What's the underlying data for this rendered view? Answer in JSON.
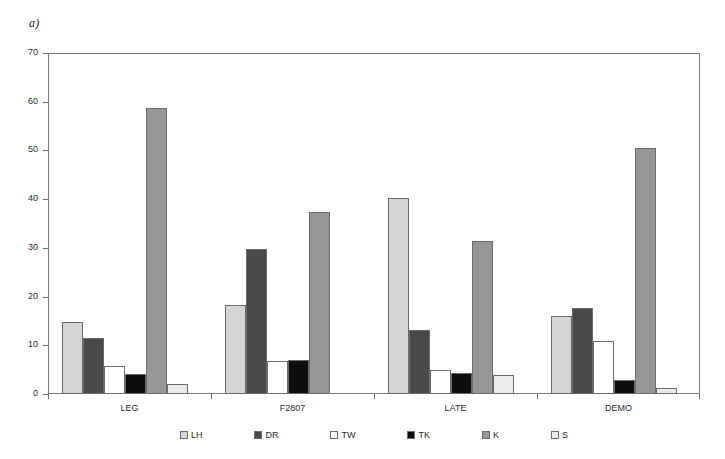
{
  "panel": {
    "label": "a)"
  },
  "chart_data": {
    "type": "bar",
    "title": "",
    "subtitle": "",
    "xlabel": "",
    "ylabel": "",
    "ylim": [
      0,
      70
    ],
    "yticks": [
      0,
      10,
      20,
      30,
      40,
      50,
      60,
      70
    ],
    "ytick_labels": [
      "0",
      "10",
      "20",
      "30",
      "40",
      "50",
      "60",
      "70"
    ],
    "grid": false,
    "legend_position": "bottom",
    "categories": [
      "LEG",
      "F2807",
      "LATE",
      "DEMO"
    ],
    "series": [
      {
        "name": "LH",
        "color": "#d4d4d4",
        "values": [
          14.8,
          18.2,
          40.2,
          16.0
        ]
      },
      {
        "name": "DR",
        "color": "#4a4a4a",
        "values": [
          11.6,
          29.8,
          13.2,
          17.6
        ]
      },
      {
        "name": "TW",
        "color": "#ffffff",
        "values": [
          5.7,
          6.7,
          4.9,
          10.8
        ]
      },
      {
        "name": "TK",
        "color": "#0d0d0d",
        "values": [
          4.2,
          7.0,
          4.4,
          2.8
        ]
      },
      {
        "name": "K",
        "color": "#969696",
        "values": [
          58.8,
          37.3,
          31.5,
          50.4
        ]
      },
      {
        "name": "S",
        "color": "#ebebeb",
        "values": [
          2.0,
          0.0,
          4.0,
          1.3
        ]
      }
    ]
  },
  "colors": {
    "axis": "#7d7d7d",
    "tick": "#6e6e6e",
    "bar_outline": "#6b6b6b",
    "text": "#2b2b2b",
    "background": "#ffffff"
  }
}
